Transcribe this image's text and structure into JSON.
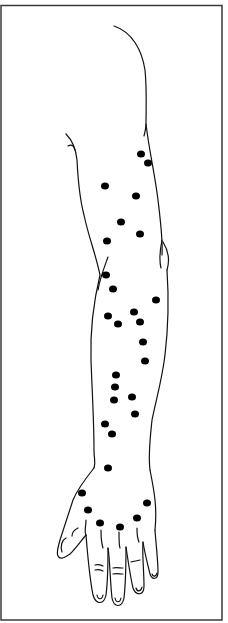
{
  "figure": {
    "title": "",
    "border_color": "#3a3a3a",
    "line_color": "#111111",
    "dot_color": "#000000",
    "dot_radius": 4,
    "dots": [
      [
        141,
        154
      ],
      [
        148,
        163
      ],
      [
        105,
        186
      ],
      [
        136,
        196
      ],
      [
        121,
        222
      ],
      [
        140,
        234
      ],
      [
        107,
        241
      ],
      [
        106,
        275
      ],
      [
        113,
        289
      ],
      [
        156,
        300
      ],
      [
        134,
        312
      ],
      [
        108,
        316
      ],
      [
        140,
        322
      ],
      [
        118,
        324
      ],
      [
        143,
        342
      ],
      [
        145,
        361
      ],
      [
        116,
        375
      ],
      [
        115,
        387
      ],
      [
        132,
        397
      ],
      [
        114,
        400
      ],
      [
        135,
        414
      ],
      [
        105,
        424
      ],
      [
        112,
        434
      ],
      [
        108,
        468
      ],
      [
        82,
        493
      ],
      [
        147,
        503
      ],
      [
        88,
        510
      ],
      [
        137,
        518
      ],
      [
        100,
        523
      ],
      [
        120,
        527
      ]
    ]
  }
}
